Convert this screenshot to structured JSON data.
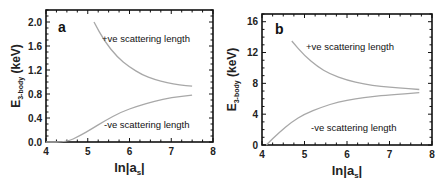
{
  "chart_data": [
    {
      "type": "line",
      "panel_label": "a",
      "xlabel": "ln|a_s|",
      "ylabel": "E_3-body (keV)",
      "xlim": [
        4,
        8
      ],
      "ylim": [
        0,
        2.2
      ],
      "xticks": [
        4,
        5,
        6,
        7,
        8
      ],
      "yticks": [
        "0.0",
        "0.4",
        "0.8",
        "1.2",
        "1.6",
        "2.0"
      ],
      "grid": false,
      "annotations": [
        "+ve scattering length",
        "-ve scattering length"
      ],
      "series": [
        {
          "name": "+ve scattering length",
          "x": [
            5.15,
            5.4,
            5.7,
            6.0,
            6.3,
            6.6,
            6.9,
            7.2,
            7.5
          ],
          "y": [
            2.0,
            1.68,
            1.42,
            1.25,
            1.12,
            1.04,
            0.99,
            0.95,
            0.93
          ]
        },
        {
          "name": "-ve scattering length",
          "x": [
            4.0,
            4.5,
            4.8,
            5.1,
            5.4,
            5.8,
            6.2,
            6.6,
            7.0,
            7.5
          ],
          "y": [
            0.0,
            0.0,
            0.1,
            0.22,
            0.35,
            0.5,
            0.6,
            0.68,
            0.74,
            0.78
          ]
        }
      ]
    },
    {
      "type": "line",
      "panel_label": "b",
      "xlabel": "ln|a_s|",
      "ylabel": "E_3-body (keV)",
      "xlim": [
        4,
        8
      ],
      "ylim": [
        0,
        17
      ],
      "xticks": [
        4,
        5,
        6,
        7,
        8
      ],
      "yticks": [
        "0",
        "4",
        "8",
        "12",
        "16"
      ],
      "grid": false,
      "annotations": [
        "+ve scattering length",
        "-ve scattering length"
      ],
      "series": [
        {
          "name": "+ve scattering length",
          "x": [
            4.7,
            5.0,
            5.3,
            5.6,
            6.0,
            6.4,
            6.8,
            7.2,
            7.7
          ],
          "y": [
            13.5,
            11.6,
            10.2,
            9.2,
            8.4,
            7.9,
            7.6,
            7.4,
            7.2
          ]
        },
        {
          "name": "-ve scattering length",
          "x": [
            4.1,
            4.4,
            4.7,
            5.0,
            5.4,
            5.8,
            6.2,
            6.6,
            7.0,
            7.7
          ],
          "y": [
            0.0,
            1.6,
            3.0,
            4.0,
            4.9,
            5.6,
            6.0,
            6.3,
            6.5,
            6.8
          ]
        }
      ]
    }
  ],
  "panels": [
    {
      "label": "a",
      "pos_label": "+ve scattering length",
      "neg_label": "-ve scattering length",
      "ylabel_main": "E",
      "ylabel_sub": "3-body",
      "ylabel_unit": " (keV)",
      "xlabel_main": "ln|a",
      "xlabel_sub": "s",
      "xlabel_end": "|",
      "yticks": [
        "0.0",
        "0.4",
        "0.8",
        "1.2",
        "1.6",
        "2.0"
      ],
      "xticks": [
        "4",
        "5",
        "6",
        "7",
        "8"
      ]
    },
    {
      "label": "b",
      "pos_label": "+ve scattering length",
      "neg_label": "-ve scattering length",
      "ylabel_main": "E",
      "ylabel_sub": "3-body",
      "ylabel_unit": " (keV)",
      "xlabel_main": "ln|a",
      "xlabel_sub": "s",
      "xlabel_end": "|",
      "yticks": [
        "0",
        "4",
        "8",
        "12",
        "16"
      ],
      "xticks": [
        "4",
        "5",
        "6",
        "7",
        "8"
      ]
    }
  ],
  "colors": {
    "curve": "#a8a8a8",
    "axis": "#111111"
  }
}
